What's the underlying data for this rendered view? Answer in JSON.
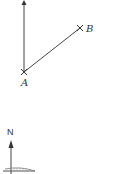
{
  "figure1": {
    "point_a_label": "A",
    "point_b_label": "B",
    "elements": [
      "north-line-arrow",
      "segment-AB"
    ]
  },
  "figure2": {
    "north_label": "N",
    "elements": [
      "north-arrow",
      "baseline",
      "hatched-arc"
    ]
  },
  "colors": {
    "line": "#444444",
    "background": "#ffffff"
  }
}
